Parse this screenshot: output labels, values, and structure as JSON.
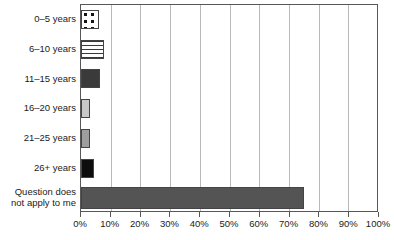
{
  "chart_data": {
    "type": "bar",
    "orientation": "horizontal",
    "title": "",
    "xlabel": "",
    "ylabel": "",
    "xlim": [
      0,
      100
    ],
    "grid": true,
    "legend": "none",
    "categories": [
      "0–5 years",
      "6–10 years",
      "11–15 years",
      "16–20 years",
      "21–25 years",
      "26+ years",
      "Question does\nnot apply to me"
    ],
    "values": [
      6.0,
      7.7,
      6.3,
      3.0,
      3.0,
      4.3,
      74.8
    ],
    "value_labels": [
      "6%",
      "7.7%",
      "6.3%",
      "3%",
      "3%",
      "4.3%",
      "74.8%"
    ],
    "xticks": [
      0,
      10,
      20,
      30,
      40,
      50,
      60,
      70,
      80,
      90,
      100
    ],
    "xticklabels": [
      "0%",
      "10%",
      "20%",
      "30%",
      "40%",
      "50%",
      "60%",
      "70%",
      "80%",
      "90%",
      "100%"
    ],
    "bar_styles": [
      {
        "name": "dotted-pattern",
        "fill": "fill-dots",
        "color": "#ffffff"
      },
      {
        "name": "horizontal-lines",
        "fill": "fill-hlines",
        "color": "#ffffff"
      },
      {
        "name": "dark-gray",
        "fill": "fill-darkgray",
        "color": "#3a3a3a"
      },
      {
        "name": "light-gray",
        "fill": "fill-lightgray",
        "color": "#c8c8c8"
      },
      {
        "name": "medium-gray",
        "fill": "fill-midgray",
        "color": "#9e9e9e"
      },
      {
        "name": "black",
        "fill": "fill-black",
        "color": "#0d0d0d"
      },
      {
        "name": "slate-gray",
        "fill": "fill-slate",
        "color": "#545454"
      }
    ],
    "colors": {
      "axis": "#575757",
      "grid": "#b9b9b9",
      "text": "#1b1b1b",
      "background": "#ffffff"
    }
  }
}
